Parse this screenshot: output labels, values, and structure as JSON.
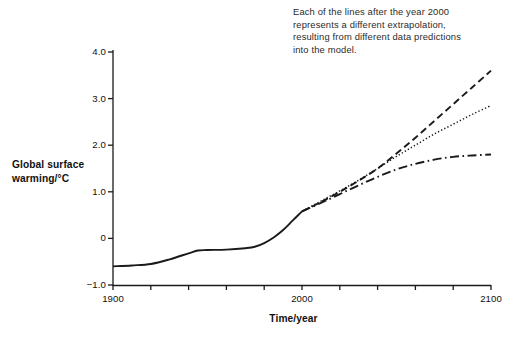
{
  "annotation": {
    "line1": "Each of the lines after the year 2000",
    "line2": "represents a different extrapolation,",
    "line3": "resulting from different data predictions",
    "line4": "into the model."
  },
  "axis_titles": {
    "y_line1": "Global surface",
    "y_line2": "warming/°C",
    "x": "Time/year"
  },
  "y_ticks": [
    "4.0",
    "3.0",
    "2.0",
    "1.0",
    "0",
    "−1.0"
  ],
  "x_ticks": [
    "1900",
    "2000",
    "2100"
  ],
  "colors": {
    "axis": "#1a1a1a",
    "line": "#1a1a1a",
    "background": "#ffffff",
    "text": "#1a1a1a"
  },
  "chart_data": {
    "type": "line",
    "title": "",
    "xlabel": "Time/year",
    "ylabel": "Global surface warming/°C",
    "xlim": [
      1900,
      2100
    ],
    "ylim": [
      -1.0,
      4.0
    ],
    "yticks": [
      -1.0,
      0,
      1.0,
      2.0,
      3.0,
      4.0
    ],
    "ytick_labels": [
      "−1.0",
      "0",
      "1.0",
      "2.0",
      "3.0",
      "4.0"
    ],
    "xticks": [
      1900,
      1920,
      1940,
      1960,
      1980,
      2000,
      2020,
      2040,
      2060,
      2080,
      2100
    ],
    "xtick_labels": [
      "1900",
      "",
      "",
      "",
      "",
      "2000",
      "",
      "",
      "",
      "",
      "2100"
    ],
    "grid": false,
    "legend": "none",
    "annotations": [
      {
        "text": "Each of the lines after the year 2000 represents a different extrapolation, resulting from different data predictions into the model.",
        "x": 2005,
        "y": 3.9
      }
    ],
    "series": [
      {
        "name": "Observed global surface warming",
        "style": "solid",
        "x": [
          1900,
          1910,
          1920,
          1930,
          1940,
          1945,
          1950,
          1960,
          1970,
          1975,
          1980,
          1985,
          1990,
          1995,
          2000
        ],
        "values": [
          -0.6,
          -0.58,
          -0.55,
          -0.45,
          -0.32,
          -0.26,
          -0.25,
          -0.24,
          -0.21,
          -0.18,
          -0.1,
          0.02,
          0.18,
          0.38,
          0.58
        ]
      },
      {
        "name": "High extrapolation",
        "style": "dashed",
        "x": [
          2000,
          2010,
          2020,
          2030,
          2040,
          2050,
          2060,
          2070,
          2080,
          2090,
          2100
        ],
        "values": [
          0.58,
          0.78,
          1.0,
          1.24,
          1.5,
          1.82,
          2.16,
          2.52,
          2.88,
          3.24,
          3.6
        ]
      },
      {
        "name": "Medium extrapolation",
        "style": "dotted",
        "x": [
          2000,
          2010,
          2020,
          2030,
          2040,
          2050,
          2060,
          2070,
          2080,
          2090,
          2100
        ],
        "values": [
          0.58,
          0.8,
          1.02,
          1.25,
          1.5,
          1.76,
          2.0,
          2.24,
          2.45,
          2.66,
          2.85
        ]
      },
      {
        "name": "Low extrapolation",
        "style": "dash-dot",
        "x": [
          2000,
          2010,
          2020,
          2030,
          2040,
          2050,
          2060,
          2070,
          2080,
          2090,
          2100
        ],
        "values": [
          0.58,
          0.76,
          0.95,
          1.14,
          1.32,
          1.48,
          1.6,
          1.69,
          1.75,
          1.78,
          1.8
        ]
      }
    ]
  }
}
